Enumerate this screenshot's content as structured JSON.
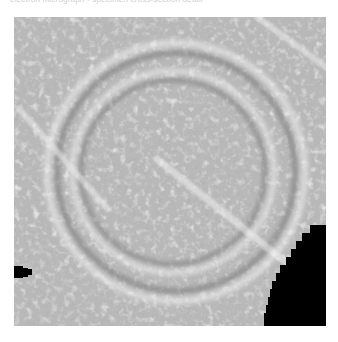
{
  "page": {
    "background_color": "#ffffff",
    "width": 338,
    "height": 342
  },
  "caption": {
    "text": "electron micrograph  -  specimen cross-section detail",
    "color": "#cfcfcf",
    "truncated": true
  },
  "micrograph": {
    "label": "grayscale electron micrograph",
    "x": 14,
    "y": 17,
    "width": 312,
    "height": 309,
    "base_gray": "#9a9a9a",
    "light_gray": "#e8e8e8",
    "mid_gray": "#b4b4b4",
    "dark_gray": "#6b6b6b",
    "black": "#000000",
    "description": "mottled granular texture with concentric circular ring structures, a bright diagonal streak through the centre, diagonal streaks in the upper-left, and black occluded regions",
    "features": {
      "rings": [
        {
          "name": "outer-ring",
          "cx": 0.52,
          "cy": 0.5,
          "r": 0.415,
          "stroke": "#e8e8e8",
          "width": 0.03
        },
        {
          "name": "outer-ring-shadow",
          "cx": 0.52,
          "cy": 0.5,
          "r": 0.385,
          "stroke": "#6f6f6f",
          "width": 0.026
        },
        {
          "name": "mid-ring",
          "cx": 0.51,
          "cy": 0.5,
          "r": 0.325,
          "stroke": "#ededed",
          "width": 0.028
        },
        {
          "name": "mid-ring-shadow",
          "cx": 0.51,
          "cy": 0.5,
          "r": 0.298,
          "stroke": "#707070",
          "width": 0.024
        },
        {
          "name": "inner-ring",
          "cx": 0.5,
          "cy": 0.5,
          "r": 0.245,
          "stroke": "#e3e3e3",
          "width": 0.022
        }
      ],
      "streaks": [
        {
          "name": "central-diagonal-streak",
          "x1": 0.46,
          "y1": 0.46,
          "x2": 0.88,
          "y2": 0.8,
          "stroke": "#f0f0f0",
          "width": 0.03
        },
        {
          "name": "upper-left-streak-a",
          "x1": 0.02,
          "y1": 0.3,
          "x2": 0.3,
          "y2": 0.62,
          "stroke": "#ececec",
          "width": 0.024
        },
        {
          "name": "upper-left-streak-b",
          "x1": 0.0,
          "y1": 0.46,
          "x2": 0.26,
          "y2": 0.3,
          "stroke": "#e4e4e4",
          "width": 0.018
        },
        {
          "name": "top-right-streak",
          "x1": 0.78,
          "y1": 0.0,
          "x2": 1.0,
          "y2": 0.16,
          "stroke": "#ededed",
          "width": 0.026
        },
        {
          "name": "left-horizontal-streak",
          "x1": 0.0,
          "y1": 0.55,
          "x2": 0.22,
          "y2": 0.55,
          "stroke": "#e0e0e0",
          "width": 0.016
        }
      ],
      "occluders": [
        {
          "name": "left-edge-black-blob",
          "x": 0,
          "y": 249,
          "width": 20,
          "height": 12
        },
        {
          "name": "bottom-right-black-corner",
          "x": 270,
          "y": 222,
          "width": 42,
          "height": 87
        }
      ]
    }
  }
}
